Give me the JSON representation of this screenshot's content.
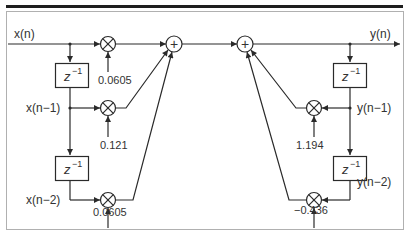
{
  "diagram": {
    "type": "IIR filter signal flow graph (direct form I, second order)",
    "signals": {
      "input": "x(n)",
      "input_d1": "x(n−1)",
      "input_d2": "x(n−2)",
      "output": "y(n)",
      "output_d1": "y(n−1)",
      "output_d2": "y(n−2)"
    },
    "delay_label": "z",
    "delay_exponent": "−1",
    "coefficients": {
      "b0": "0.0605",
      "b1": "0.121",
      "b2": "0.0605",
      "a1": "1.194",
      "a2": "−0.436"
    },
    "adder_symbol": "+",
    "colors": {
      "line": "#2a2a2a",
      "frame": "#aaaaaa",
      "top_rule": "#1e1e1e",
      "text": "#333333"
    }
  }
}
